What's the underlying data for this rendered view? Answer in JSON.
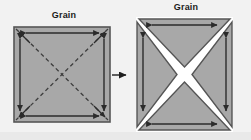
{
  "figure": {
    "background_color": "#f2f2f2",
    "fabric_color": "#a8a8a8",
    "line_color": "#3a3a3a",
    "gap_color": "#ffffff"
  },
  "left_panel": {
    "label": "Grain",
    "shape": "square",
    "fill": "#a8a8a8",
    "border_color": "#4a4a4a",
    "cut_lines": "dashed-diagonals",
    "arrows": {
      "top": "double-headed-horizontal",
      "bottom": "double-headed-horizontal",
      "left": "double-headed-vertical",
      "right": "double-headed-vertical",
      "diagonal_corner_arrows": 4
    }
  },
  "transition": {
    "icon": "arrow-right-icon",
    "direction": "right"
  },
  "right_panel": {
    "label": "Grain",
    "shape": "square-split-into-four-triangles",
    "fill": "#a8a8a8",
    "border_color": "#4a4a4a",
    "gap": "x-shaped-white-gap",
    "triangles": [
      "top",
      "right",
      "bottom",
      "left"
    ],
    "arrows": {
      "top_triangle": "double-headed-horizontal",
      "bottom_triangle": "double-headed-horizontal",
      "left_triangle": "double-headed-vertical",
      "right_triangle": "double-headed-vertical"
    }
  }
}
